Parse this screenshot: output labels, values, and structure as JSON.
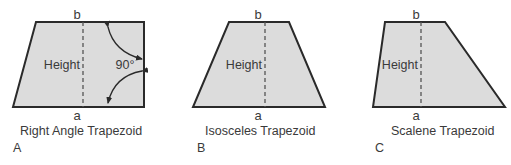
{
  "figures": [
    {
      "letter": "A",
      "caption": "Right Angle Trapezoid",
      "top_label": "b",
      "bottom_label": "a",
      "height_label": "Height",
      "angle_label": "90°"
    },
    {
      "letter": "B",
      "caption": "Isosceles Trapezoid",
      "top_label": "b",
      "bottom_label": "a",
      "height_label": "Height"
    },
    {
      "letter": "C",
      "caption": "Scalene Trapezoid",
      "top_label": "b",
      "bottom_label": "a",
      "height_label": "Height"
    }
  ],
  "colors": {
    "fill": "#dcdcdc",
    "stroke": "#2a2a2a",
    "text": "#3a3a3a"
  }
}
